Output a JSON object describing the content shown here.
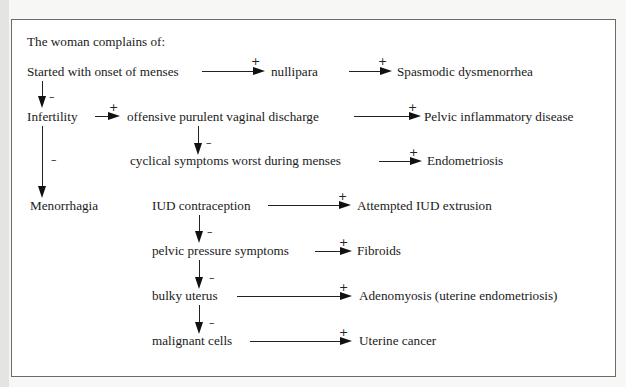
{
  "title": "The woman complains of:",
  "nodes": {
    "onset": "Started with onset of menses",
    "nullipara": "nullipara",
    "spasmodic": "Spasmodic dysmenorrhea",
    "infertility": "Infertility",
    "discharge": "offensive purulent vaginal discharge",
    "pid": "Pelvic inflammatory disease",
    "cyclical": "cyclical symptoms worst during menses",
    "endometriosis": "Endometriosis",
    "menorrhagia": "Menorrhagia",
    "iud": "IUD contraception",
    "iud_extrusion": "Attempted IUD extrusion",
    "pelvic_pressure": "pelvic pressure symptoms",
    "fibroids": "Fibroids",
    "bulky": "bulky uterus",
    "adenomyosis": "Adenomyosis (uterine endometriosis)",
    "malignant": "malignant cells",
    "cancer": "Uterine cancer"
  },
  "signs": {
    "plus": "+",
    "minus": "–"
  },
  "edges": [
    {
      "from": "onset",
      "to": "nullipara",
      "sign": "+"
    },
    {
      "from": "nullipara",
      "to": "spasmodic",
      "sign": "+"
    },
    {
      "from": "onset",
      "to": "infertility",
      "sign": "-"
    },
    {
      "from": "infertility",
      "to": "discharge",
      "sign": "+"
    },
    {
      "from": "discharge",
      "to": "pid",
      "sign": "+"
    },
    {
      "from": "discharge",
      "to": "cyclical",
      "sign": "-"
    },
    {
      "from": "cyclical",
      "to": "endometriosis",
      "sign": "+"
    },
    {
      "from": "infertility",
      "to": "menorrhagia",
      "sign": "-"
    },
    {
      "from": "iud",
      "to": "iud_extrusion",
      "sign": "+"
    },
    {
      "from": "iud",
      "to": "pelvic_pressure",
      "sign": "-"
    },
    {
      "from": "pelvic_pressure",
      "to": "fibroids",
      "sign": "+"
    },
    {
      "from": "pelvic_pressure",
      "to": "bulky",
      "sign": "-"
    },
    {
      "from": "bulky",
      "to": "adenomyosis",
      "sign": "+"
    },
    {
      "from": "bulky",
      "to": "malignant",
      "sign": "-"
    },
    {
      "from": "malignant",
      "to": "cancer",
      "sign": "+"
    }
  ]
}
